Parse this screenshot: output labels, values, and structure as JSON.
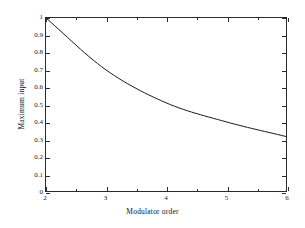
{
  "chart_data": {
    "type": "line",
    "title": "",
    "xlabel": "Modulator order",
    "ylabel": "Maximum input",
    "xlim": [
      2,
      6
    ],
    "ylim": [
      0,
      1
    ],
    "grid": false,
    "legend": null,
    "xticks": [
      2,
      3,
      4,
      5,
      6
    ],
    "xticklabels": [
      "2",
      "3",
      "4",
      "5",
      "6"
    ],
    "xminorticks": [
      2.5,
      3.5,
      4.5,
      5.5
    ],
    "yticks": [
      0,
      0.1,
      0.2,
      0.3,
      0.4,
      0.5,
      0.6,
      0.7,
      0.8,
      0.9,
      1
    ],
    "yticklabels": [
      "0",
      "0.1",
      "0.2",
      "0.3",
      "0.4",
      "0.5",
      "0.6",
      "0.7",
      "0.8",
      "0.9",
      "1"
    ],
    "x": [
      2,
      3,
      4,
      5,
      6
    ],
    "y": [
      1.0,
      0.7,
      0.51,
      0.4,
      0.315
    ],
    "series": [
      {
        "name": "Maximum input",
        "x": [
          2,
          3,
          4,
          5,
          6
        ],
        "values": [
          1.0,
          0.7,
          0.51,
          0.4,
          0.315
        ],
        "color": "#1a1a1a",
        "linewidth": 1,
        "marker": "none"
      }
    ],
    "annotations": []
  },
  "figure": {
    "background_color": "#ffffff",
    "axes_color": "#2b2b2b"
  }
}
